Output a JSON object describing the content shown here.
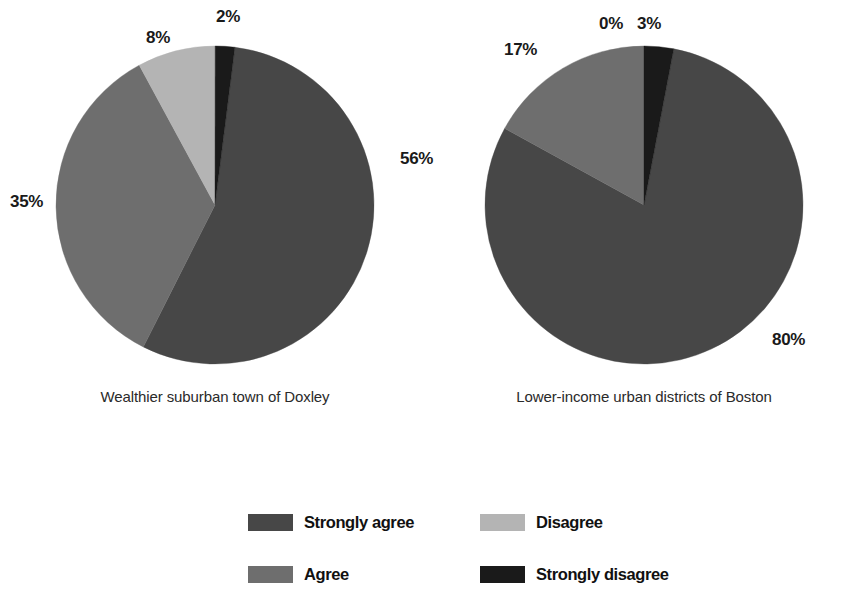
{
  "chart_data": {
    "type": "pie",
    "title": "",
    "legend_position": "bottom",
    "categories": [
      "Strongly agree",
      "Agree",
      "Disagree",
      "Strongly disagree"
    ],
    "colors": [
      "#474747",
      "#6e6e6e",
      "#b4b4b4",
      "#1a1a1a"
    ],
    "charts": [
      {
        "name": "Wealthier suburban town of Doxley",
        "values": [
          56,
          35,
          8,
          2
        ],
        "labels": [
          "56%",
          "35%",
          "8%",
          "2%"
        ],
        "start_angle_deg": 7.2,
        "direction": "clockwise"
      },
      {
        "name": "Lower-income urban districts of Boston",
        "values": [
          80,
          17,
          0,
          3
        ],
        "labels": [
          "80%",
          "17%",
          "0%",
          "3%"
        ],
        "start_angle_deg": 10.8,
        "direction": "clockwise"
      }
    ]
  },
  "panels": [
    {
      "caption": "Wealthier suburban town of Doxley",
      "pct_labels": [
        {
          "text": "56%",
          "left": "400px",
          "top": "150px"
        },
        {
          "text": "35%",
          "left": "10px",
          "top": "193px"
        },
        {
          "text": "8%",
          "left": "146px",
          "top": "29px"
        },
        {
          "text": "2%",
          "left": "216px",
          "top": "8px"
        }
      ]
    },
    {
      "caption": "Lower-income urban districts of Boston",
      "pct_labels": [
        {
          "text": "80%",
          "left": "343px",
          "top": "331px"
        },
        {
          "text": "17%",
          "left": "75px",
          "top": "41px"
        },
        {
          "text": "0%",
          "left": "170px",
          "top": "15px"
        },
        {
          "text": "3%",
          "left": "208px",
          "top": "15px"
        }
      ]
    }
  ],
  "legend": {
    "items": [
      {
        "label": "Strongly agree",
        "color": "#474747"
      },
      {
        "label": "Disagree",
        "color": "#b4b4b4"
      },
      {
        "label": "Agree",
        "color": "#6e6e6e"
      },
      {
        "label": "Strongly disagree",
        "color": "#1a1a1a"
      }
    ]
  }
}
